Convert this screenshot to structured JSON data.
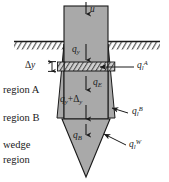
{
  "figure": {
    "colors": {
      "fill_gray": "#a9a9a9",
      "line": "#1a1a1a",
      "background": "#ffffff",
      "hatch": "#1a1a1a"
    }
  },
  "labels": {
    "velocity": "u",
    "flux_y": {
      "base": "q",
      "sub": "y"
    },
    "flux_y_plus": {
      "base": "q",
      "sub": "y",
      "plus": "+",
      "delta": "Δ",
      "delta_sub": "y"
    },
    "flux_E": {
      "base": "q",
      "sub": "E"
    },
    "flux_B": {
      "base": "q",
      "sub": "B"
    },
    "flux_l_A": {
      "base": "q",
      "sub": "l",
      "sup": "A"
    },
    "flux_l_B": {
      "base": "q",
      "sub": "l",
      "sup": "B"
    },
    "flux_l_W": {
      "base": "q",
      "sub": "l",
      "sup": "W"
    },
    "delta_y": {
      "delta": "Δ",
      "var": "y"
    },
    "region_a": "region A",
    "region_b": "region B",
    "wedge_line1": "wedge",
    "wedge_line2": "region"
  }
}
